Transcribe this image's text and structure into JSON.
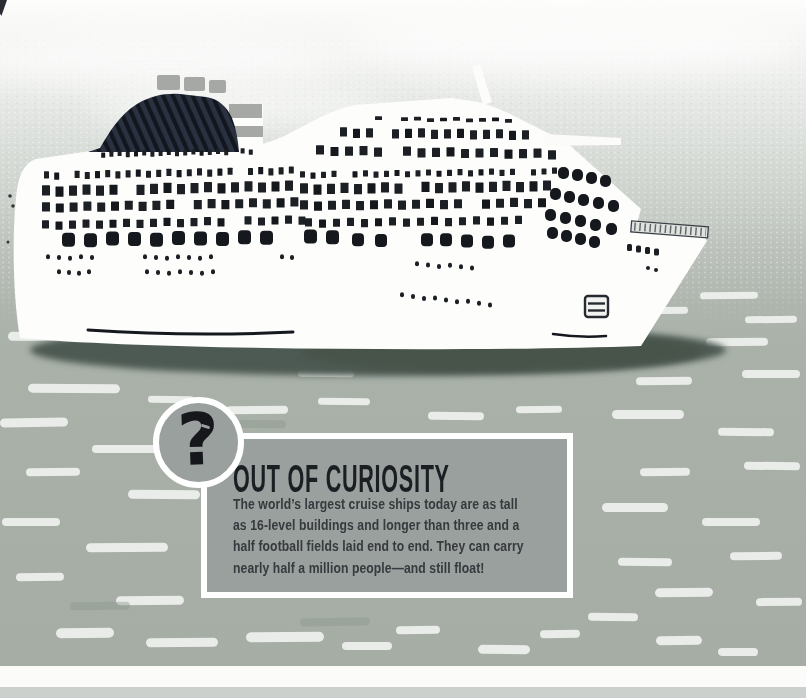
{
  "callout": {
    "question_mark": "?",
    "title": "OUT OF CURIOSITY",
    "body_lines": [
      "The world’s largest cruise ships today are as tall",
      "as 16-level buildings and longer than three and a",
      "half football fields laid end to end. They can carry",
      "nearly half a million people—and still float!"
    ]
  },
  "illustration": {
    "subject": "large white cruise ship floating on water",
    "colors": {
      "sky_top": "#fdfdfc",
      "sky_mid": "#cfd4cf",
      "water": "#a7afa7",
      "wave_streak": "#eff1ee",
      "ship_hull": "#fdfdfc",
      "ship_windows": "#1c2025",
      "dome_stripe_dark": "#12161f",
      "dome_stripe_light": "#2a3140",
      "funnel_band": "#a5a8a4",
      "ship_shadow": "#4e5a53",
      "box_fill": "#9aa09d",
      "box_border": "#ffffff",
      "title_text": "#1b1e23",
      "body_text": "#36393d"
    }
  }
}
